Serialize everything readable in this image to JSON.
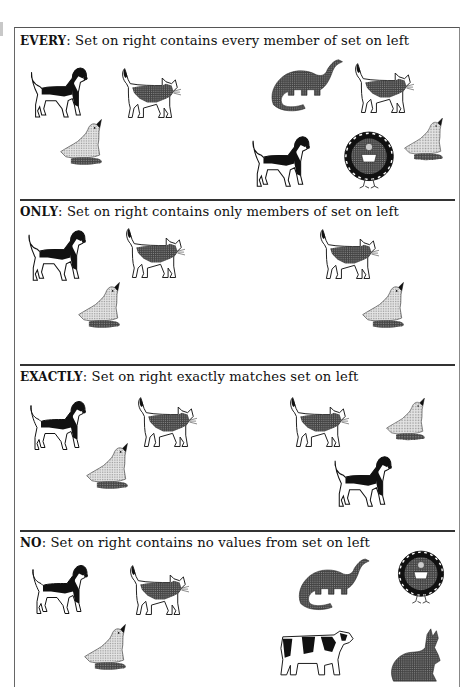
{
  "sections": [
    {
      "keyword": "EVERY",
      "description": ": Set on right contains every member of set on left",
      "left_set": [
        "dog",
        "cat",
        "duck"
      ],
      "right_set": [
        "dinosaur",
        "cat",
        "dog",
        "turkey",
        "duck"
      ]
    },
    {
      "keyword": "ONLY",
      "description": ": Set on right contains only members of set on left",
      "left_set": [
        "dog",
        "cat",
        "duck"
      ],
      "right_set": [
        "cat",
        "duck"
      ]
    },
    {
      "keyword": "EXACTLY",
      "description": ": Set on right exactly matches set on left",
      "left_set": [
        "dog",
        "cat",
        "duck"
      ],
      "right_set": [
        "cat",
        "duck",
        "dog"
      ]
    },
    {
      "keyword": "NO",
      "description": ": Set on right contains no values from set on left",
      "left_set": [
        "dog",
        "cat",
        "duck"
      ],
      "right_set": [
        "dinosaur",
        "turkey",
        "cow",
        "rabbit"
      ]
    }
  ],
  "colors": {
    "ink": "#111111",
    "gray_fill": "#8a8a8a",
    "light_fill": "#d8d8d8",
    "background": "#ffffff"
  }
}
